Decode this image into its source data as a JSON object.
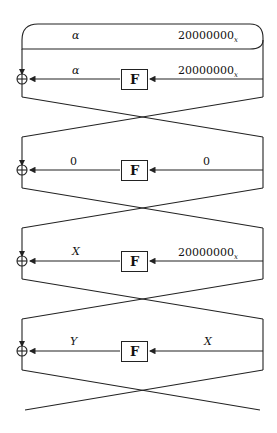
{
  "diagram": {
    "type": "feistel-differential-characteristic",
    "input": {
      "left": "α",
      "right": "20000000",
      "right_subscript": "x"
    },
    "function_label": "F",
    "rounds": [
      {
        "index": 1,
        "f_input": "20000000",
        "f_input_subscript": "x",
        "f_output": "α",
        "f_output_italic": true
      },
      {
        "index": 2,
        "f_input": "0",
        "f_input_subscript": "",
        "f_output": "0",
        "f_output_italic": false
      },
      {
        "index": 3,
        "f_input": "20000000",
        "f_input_subscript": "x",
        "f_output": "X",
        "f_output_italic": true
      },
      {
        "index": 4,
        "f_input": "X",
        "f_input_subscript": "",
        "f_output": "Y",
        "f_output_italic": true
      }
    ],
    "xor_symbol": "⊕",
    "colors": {
      "line": "#222222",
      "background": "#ffffff"
    }
  }
}
